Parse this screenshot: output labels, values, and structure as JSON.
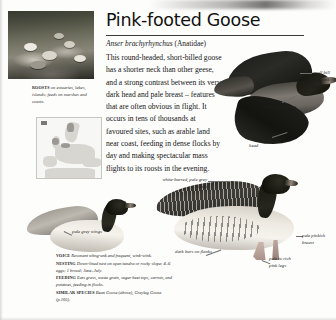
{
  "page": {
    "title": "Pink-footed Goose",
    "scientific_name": "Anser brachyrhynchus",
    "family": "(Anatidae)",
    "body": "This round-headed, short-billed goose has a shorter neck than other geese, and a strong contrast between its very dark head and pale breast – features that are often obvious in flight. It occurs in tens of thousands at favoured sites, such as arable land near coast, feeding in dense flocks by day and making spectacular mass flights to its roosts in the evening."
  },
  "habitat_caption": {
    "keyword": "ROOSTS",
    "text": " on estuaries, lakes, islands; feeds on marshes and coasts."
  },
  "map": {
    "name": "europe-distribution-map",
    "key_label": ""
  },
  "annotations": [
    {
      "id": "small-bill",
      "text": "small bill with pink band"
    },
    {
      "id": "underwings",
      "text": "dark underwings"
    },
    {
      "id": "round-head",
      "text": "dark, round head"
    },
    {
      "id": "grey-back",
      "text": "white-barred, pale grey back"
    },
    {
      "id": "pale-wings",
      "text": "pale grey wings"
    },
    {
      "id": "dark-bars",
      "text": "dark bars on flanks"
    },
    {
      "id": "pink-breast",
      "text": "pale pinkish breast"
    },
    {
      "id": "pink-legs",
      "text": "pale to rich pink legs"
    }
  ],
  "factfile": {
    "voice": {
      "keyword": "VOICE",
      "text": " Resonant whng-unk and frequent, wink-wink."
    },
    "nesting": {
      "keyword": "NESTING",
      "text": " Down-lined nest on open tundra or rocky slope; 4–6 eggs; 1 brood; June–July."
    },
    "feeding": {
      "keyword": "FEEDING",
      "text": " Eats grass, waste grain, sugar beet tops, carrots, and potatoes, feeding in flocks."
    },
    "similar": {
      "keyword": "SIMILAR SPECIES",
      "text": " Bean Goose (above), Greylag Goose (p.105)."
    }
  },
  "colors": {
    "text": "#141414",
    "rule": "#3a3a3a",
    "annotation": "#1f1f1f",
    "page_background": "#fdfdfc"
  }
}
